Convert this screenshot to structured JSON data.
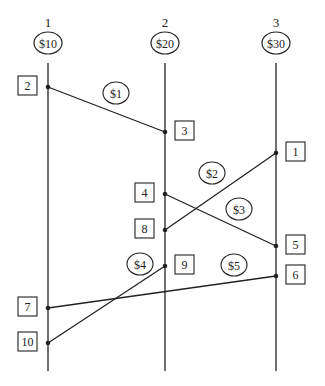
{
  "diagram": {
    "type": "space-time / message sequence diagram",
    "processes": [
      {
        "id": "1",
        "label": "1",
        "initial_amount": "$10",
        "x": 48
      },
      {
        "id": "2",
        "label": "2",
        "initial_amount": "$20",
        "x": 165
      },
      {
        "id": "3",
        "label": "3",
        "initial_amount": "$30",
        "x": 276
      }
    ],
    "events": [
      {
        "label": "2",
        "process": 0,
        "y": 87,
        "box_side": "left"
      },
      {
        "label": "3",
        "process": 1,
        "y": 132,
        "box_side": "right"
      },
      {
        "label": "1",
        "process": 2,
        "y": 153,
        "box_side": "right"
      },
      {
        "label": "4",
        "process": 1,
        "y": 194,
        "box_side": "left"
      },
      {
        "label": "8",
        "process": 1,
        "y": 230,
        "box_side": "left"
      },
      {
        "label": "5",
        "process": 2,
        "y": 246,
        "box_side": "right"
      },
      {
        "label": "9",
        "process": 1,
        "y": 266,
        "box_side": "right"
      },
      {
        "label": "6",
        "process": 2,
        "y": 276,
        "box_side": "right"
      },
      {
        "label": "7",
        "process": 0,
        "y": 308,
        "box_side": "left"
      },
      {
        "label": "10",
        "process": 0,
        "y": 343,
        "box_side": "left"
      }
    ],
    "messages": [
      {
        "amount": "$1",
        "from_event": "2",
        "to_event": "3",
        "label_pos": [
          116,
          93
        ]
      },
      {
        "amount": "$2",
        "from_event": "1",
        "to_event": "8",
        "label_pos": [
          212,
          173
        ]
      },
      {
        "amount": "$3",
        "from_event": "4",
        "to_event": "5",
        "label_pos": [
          239,
          209
        ]
      },
      {
        "amount": "$4",
        "from_event": "10",
        "to_event": "9",
        "label_pos": [
          140,
          264
        ]
      },
      {
        "amount": "$5",
        "from_event": "6",
        "to_event": "7",
        "label_pos": [
          234,
          265
        ]
      }
    ]
  },
  "colors": {
    "line": "#222222",
    "background": "#ffffff"
  }
}
